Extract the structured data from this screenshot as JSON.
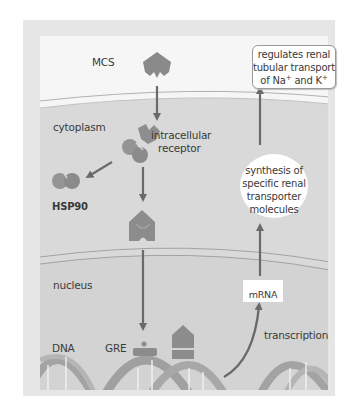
{
  "diagram": {
    "regions": {
      "cytoplasm": "cytoplasm",
      "nucleus": "nucleus"
    },
    "labels": {
      "ligand": "MCS",
      "receptor_line1": "intracellular",
      "receptor_line2": "receptor",
      "chaperone": "HSP90",
      "dna": "DNA",
      "response_element": "GRE",
      "transcription": "transcription",
      "mrna": "mRNA"
    },
    "boxes": {
      "regulates": {
        "line1": "regulates renal",
        "line2": "tubular transport",
        "line3_prefix": "of Na",
        "line3_sup1": "+",
        "line3_mid": " and K",
        "line3_sup2": "+"
      },
      "synthesis": {
        "line1": "synthesis of",
        "line2": "specific renal",
        "line3": "transporter",
        "line4": "molecules"
      }
    },
    "colors": {
      "frame": "#e6e6e6",
      "extracellular": "#f6f6f6",
      "cytoplasm": "#d9d9d9",
      "nucleus": "#d3d3d3",
      "membrane_line": "#a8a8a8",
      "protein": "#8c8c8c",
      "arrow": "#6a6a6a",
      "dna_strand": "#9a9a9a",
      "box_fill": "#ffffff",
      "text": "#3a3a3a"
    }
  }
}
